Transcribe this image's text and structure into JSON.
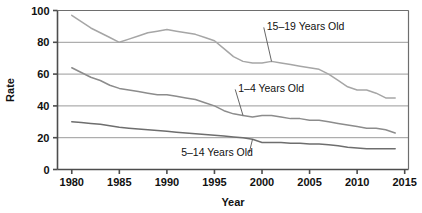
{
  "chart_data": {
    "type": "line",
    "title": "",
    "xlabel": "Year",
    "ylabel": "Rate",
    "xlim": [
      1978.5,
      2015.4
    ],
    "ylim": [
      0,
      100
    ],
    "xticks": [
      "1980",
      "1985",
      "1990",
      "1995",
      "2000",
      "2005",
      "2010",
      "2015"
    ],
    "yticks": [
      "0",
      "20",
      "40",
      "60",
      "80",
      "100"
    ],
    "grid": "horizontal",
    "legend": "inline-annotations",
    "x": [
      1980,
      1981,
      1982,
      1983,
      1984,
      1985,
      1986,
      1987,
      1988,
      1989,
      1990,
      1991,
      1992,
      1993,
      1994,
      1995,
      1996,
      1997,
      1998,
      1999,
      2000,
      2001,
      2002,
      2003,
      2004,
      2005,
      2006,
      2007,
      2008,
      2009,
      2010,
      2011,
      2012,
      2013,
      2014
    ],
    "series": [
      {
        "name": "15–19 Years Old",
        "color": "#a6a6a6",
        "label_x": 2000.5,
        "label_y": 90,
        "values": [
          97,
          93,
          89,
          86,
          83,
          80,
          82,
          84,
          86,
          87,
          88,
          87,
          86,
          85,
          83,
          81,
          76,
          71,
          68,
          67,
          67,
          68,
          67,
          66,
          65,
          64,
          63,
          60,
          56,
          52,
          50,
          50,
          48,
          45,
          45
        ]
      },
      {
        "name": "1–4 Years Old",
        "color": "#8c8c8c",
        "label_x": 1997.5,
        "label_y": 51,
        "values": [
          64,
          61,
          58,
          56,
          53,
          51,
          50,
          49,
          48,
          47,
          47,
          46,
          45,
          44,
          42,
          40,
          37,
          35,
          34,
          33,
          34,
          34,
          33,
          32,
          32,
          31,
          31,
          30,
          29,
          28,
          27,
          26,
          26,
          25,
          23
        ]
      },
      {
        "name": "5–14 Years Old",
        "color": "#6e6e6e",
        "label_x": 1991.5,
        "label_y": 11,
        "values": [
          30,
          29.5,
          29,
          28.5,
          27.5,
          26.5,
          26,
          25.5,
          25,
          24.5,
          24,
          23.5,
          23,
          22.5,
          22,
          21.5,
          21,
          20.5,
          20,
          19,
          17,
          17,
          17,
          16.5,
          16.5,
          16,
          16,
          15.5,
          15,
          14,
          13.5,
          13,
          13,
          13,
          13
        ]
      }
    ]
  }
}
